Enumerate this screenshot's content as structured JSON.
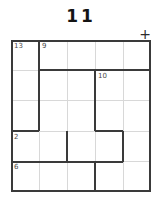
{
  "page": {
    "title": "11",
    "background_color": "#ffffff"
  },
  "marks": {
    "plus": "+"
  },
  "puzzle": {
    "type": "killer-sudoku-cage-grid",
    "rows": 5,
    "columns": 5,
    "border_color": "#3a3a3a",
    "inner_line_color": "#d8d8d8",
    "cage_line_color": "#3a3a3a",
    "sum_text_color": "#4a4a4a",
    "cages": [
      {
        "id": "cage-13",
        "sum": "13",
        "label_row": 0,
        "label_col": 0
      },
      {
        "id": "cage-9",
        "sum": "9",
        "label_row": 0,
        "label_col": 1
      },
      {
        "id": "cage-10",
        "sum": "10",
        "label_row": 1,
        "label_col": 2
      },
      {
        "id": "cage-2",
        "sum": "2",
        "label_row": 2,
        "label_col": 0
      },
      {
        "id": "cage-6",
        "sum": "6",
        "label_row": 4,
        "label_col": 0
      }
    ],
    "cells": [
      {
        "row": 0,
        "col": 0,
        "value": ""
      },
      {
        "row": 0,
        "col": 1,
        "value": ""
      },
      {
        "row": 0,
        "col": 2,
        "value": ""
      },
      {
        "row": 0,
        "col": 3,
        "value": ""
      },
      {
        "row": 0,
        "col": 4,
        "value": ""
      },
      {
        "row": 1,
        "col": 0,
        "value": ""
      },
      {
        "row": 1,
        "col": 1,
        "value": ""
      },
      {
        "row": 1,
        "col": 2,
        "value": ""
      },
      {
        "row": 1,
        "col": 3,
        "value": ""
      },
      {
        "row": 1,
        "col": 4,
        "value": ""
      },
      {
        "row": 2,
        "col": 0,
        "value": ""
      },
      {
        "row": 2,
        "col": 1,
        "value": ""
      },
      {
        "row": 2,
        "col": 2,
        "value": ""
      },
      {
        "row": 2,
        "col": 3,
        "value": ""
      },
      {
        "row": 2,
        "col": 4,
        "value": ""
      },
      {
        "row": 3,
        "col": 0,
        "value": ""
      },
      {
        "row": 3,
        "col": 1,
        "value": ""
      },
      {
        "row": 3,
        "col": 2,
        "value": ""
      },
      {
        "row": 3,
        "col": 3,
        "value": ""
      },
      {
        "row": 3,
        "col": 4,
        "value": ""
      },
      {
        "row": 4,
        "col": 0,
        "value": ""
      },
      {
        "row": 4,
        "col": 1,
        "value": ""
      },
      {
        "row": 4,
        "col": 2,
        "value": ""
      },
      {
        "row": 4,
        "col": 3,
        "value": ""
      },
      {
        "row": 4,
        "col": 4,
        "value": ""
      }
    ]
  }
}
